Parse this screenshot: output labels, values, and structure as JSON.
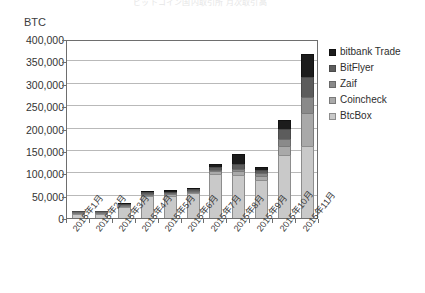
{
  "chart_data": {
    "type": "bar",
    "stacked": true,
    "title": "ビットコイン国内取引所 月次取引高",
    "ylabel": "BTC",
    "xlabel": "",
    "ylim": [
      0,
      400000
    ],
    "ytick_step": 50000,
    "grid": true,
    "legend_position": "right",
    "categories": [
      "2015年1月",
      "2015年2月",
      "2015年3月",
      "2015年4月",
      "2015年5月",
      "2015年6月",
      "2015年7月",
      "2015年8月",
      "2015年9月",
      "2015年10月",
      "2015年11月"
    ],
    "ytick_labels": [
      "0",
      "50,000",
      "100,000",
      "150,000",
      "200,000",
      "250,000",
      "300,000",
      "350,000",
      "400,000"
    ],
    "series": [
      {
        "name": "BtcBox",
        "color": "#c9c9c9",
        "values": [
          9000,
          8000,
          24000,
          49000,
          50000,
          55000,
          98000,
          96000,
          85000,
          140000,
          160000
        ]
      },
      {
        "name": "Coincheck",
        "color": "#a9a9a9",
        "values": [
          1000,
          1000,
          2000,
          3000,
          3000,
          3000,
          6000,
          8000,
          9000,
          22000,
          75000
        ]
      },
      {
        "name": "Zaif",
        "color": "#8a8a8a",
        "values": [
          500,
          500,
          1000,
          2000,
          2000,
          2000,
          4000,
          6000,
          6000,
          15000,
          35000
        ]
      },
      {
        "name": "BitFlyer",
        "color": "#5c5c5c",
        "values": [
          500,
          500,
          1000,
          3000,
          4000,
          4000,
          6000,
          10000,
          8000,
          22000,
          45000
        ]
      },
      {
        "name": "bitbank Trade",
        "color": "#1c1c1c",
        "values": [
          0,
          0,
          1000,
          3000,
          4000,
          3000,
          6000,
          24000,
          7000,
          20000,
          51000
        ]
      }
    ],
    "totals": [
      11000,
      10000,
      29000,
      60000,
      63000,
      67000,
      120000,
      144000,
      115000,
      219000,
      366000
    ]
  },
  "legend": {
    "entries": [
      {
        "label": "bitbank Trade",
        "swatch": "sw-bitbank"
      },
      {
        "label": "BitFlyer",
        "swatch": "sw-bitflyer"
      },
      {
        "label": "Zaif",
        "swatch": "sw-zaif"
      },
      {
        "label": "Coincheck",
        "swatch": "sw-coincheck"
      },
      {
        "label": "BtcBox",
        "swatch": "sw-btcbox"
      }
    ]
  }
}
